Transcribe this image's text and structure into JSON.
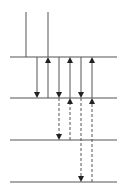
{
  "diagram": {
    "type": "energy-level-transitions",
    "colors": {
      "line": "#555555",
      "background": "#ffffff"
    },
    "levels": [
      {
        "y": 57,
        "x1": 10,
        "x2": 117
      },
      {
        "y": 98,
        "x1": 10,
        "x2": 117
      },
      {
        "y": 140,
        "x1": 10,
        "x2": 117
      },
      {
        "y": 182,
        "x1": 10,
        "x2": 117
      }
    ],
    "incoming_lines": [
      {
        "x": 26,
        "y1": 12,
        "y2": 57
      },
      {
        "x": 48,
        "y1": 12,
        "y2": 57
      }
    ],
    "solid_arrows": [
      {
        "x": 37,
        "from": 57,
        "to": 98,
        "direction": "down"
      },
      {
        "x": 48,
        "from": 98,
        "to": 57,
        "direction": "up"
      },
      {
        "x": 59,
        "from": 57,
        "to": 98,
        "direction": "down"
      },
      {
        "x": 70,
        "from": 98,
        "to": 57,
        "direction": "up"
      },
      {
        "x": 81,
        "from": 57,
        "to": 98,
        "direction": "down"
      },
      {
        "x": 92,
        "from": 98,
        "to": 57,
        "direction": "up"
      }
    ],
    "dashed_arrows": [
      {
        "x": 59,
        "from": 98,
        "to": 140,
        "direction": "down"
      },
      {
        "x": 70,
        "from": 140,
        "to": 98,
        "direction": "up"
      },
      {
        "x": 81,
        "from": 98,
        "to": 182,
        "direction": "down"
      },
      {
        "x": 92,
        "from": 182,
        "to": 98,
        "direction": "up"
      }
    ]
  }
}
